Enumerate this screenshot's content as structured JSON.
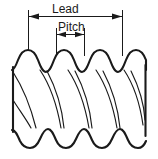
{
  "figure": {
    "type": "technical-line-drawing",
    "background_color": "#ffffff",
    "line_color": "#1a1a1a",
    "text_color": "#1a1a1a"
  },
  "dimensions": {
    "lead": {
      "label": "Lead",
      "x_start_px": 28,
      "x_end_px": 122,
      "line_y_px": 16,
      "extension_top_px": 10,
      "extension_bottom_px": 56,
      "arrow_direction": "both"
    },
    "pitch": {
      "label": "Pitch",
      "x_start_px": 56,
      "x_end_px": 84,
      "line_y_px": 34,
      "extension_top_px": 28,
      "extension_bottom_px": 56,
      "arrow_direction": "both"
    }
  },
  "thread": {
    "crest_count_top": 5,
    "crest_count_bottom": 5,
    "crest_peak_x_px": [
      28,
      56,
      84,
      112,
      140
    ],
    "top_crest_y_px": 52,
    "top_root_y_px": 72,
    "bottom_root_y_px": 128,
    "bottom_crest_y_px": 146,
    "body_left_x_px": 12,
    "body_right_x_px": 146,
    "helix_line_count": 10,
    "helix_direction": "right-hand"
  }
}
